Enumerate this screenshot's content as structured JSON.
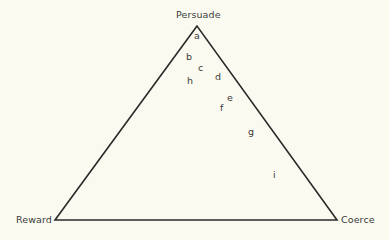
{
  "diagram": {
    "type": "triangle",
    "vertices": [
      {
        "id": "persuade",
        "label": "Persuade",
        "position": "top"
      },
      {
        "id": "reward",
        "label": "Reward",
        "position": "bottom-left"
      },
      {
        "id": "coerce",
        "label": "Coerce",
        "position": "bottom-right"
      }
    ],
    "points": [
      {
        "id": "a",
        "label": "a"
      },
      {
        "id": "b",
        "label": "b"
      },
      {
        "id": "c",
        "label": "c"
      },
      {
        "id": "d",
        "label": "d"
      },
      {
        "id": "e",
        "label": "e"
      },
      {
        "id": "f",
        "label": "f"
      },
      {
        "id": "g",
        "label": "g"
      },
      {
        "id": "h",
        "label": "h"
      },
      {
        "id": "i",
        "label": "i"
      }
    ],
    "colors": {
      "background": "#fbfaf0",
      "line": "#2a2a2a",
      "text": "#3a3a3a"
    }
  }
}
